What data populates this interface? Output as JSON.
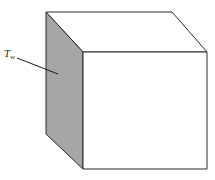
{
  "figure": {
    "type": "cube",
    "label_main": "T",
    "label_sub": "w",
    "shaded_face": "left",
    "colors": {
      "stroke": "#2a2a2a",
      "shaded_face": "#a6a6a6",
      "face": "#ffffff"
    }
  }
}
